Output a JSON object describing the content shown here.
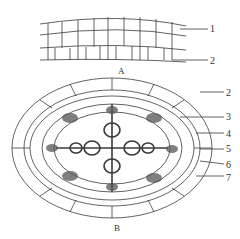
{
  "figure": {
    "panel_a": {
      "caption": "A",
      "labels": [
        {
          "num": "1",
          "x": 210,
          "y": 24
        },
        {
          "num": "2",
          "x": 210,
          "y": 56
        }
      ]
    },
    "panel_b": {
      "caption": "B",
      "labels": [
        {
          "num": "2",
          "x": 226,
          "y": 88
        },
        {
          "num": "3",
          "x": 226,
          "y": 112
        },
        {
          "num": "4",
          "x": 226,
          "y": 129
        },
        {
          "num": "5",
          "x": 226,
          "y": 144
        },
        {
          "num": "6",
          "x": 226,
          "y": 160
        },
        {
          "num": "7",
          "x": 226,
          "y": 173
        }
      ]
    },
    "colors": {
      "line": "#3a3a3a",
      "phloem": "#555555",
      "background": "#ffffff"
    }
  }
}
